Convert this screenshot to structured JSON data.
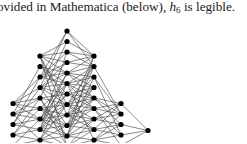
{
  "text": {
    "before": "ovided in Mathematica (below), ",
    "symbol": "h",
    "subscript": "6",
    "after": " is legible."
  },
  "figure": {
    "name": "layered-graph-h6",
    "node_color": "#000000",
    "edge_color": "#3a3a3a",
    "node_radius": 2.6,
    "node_spacing": 10.5,
    "columns": [
      {
        "x": 13,
        "y_start": 103.5
      },
      {
        "x": 40,
        "y_start": 56
      },
      {
        "x": 67,
        "y_start": 31
      },
      {
        "x": 94,
        "y_start": 56
      },
      {
        "x": 121,
        "y_start": 103.5
      },
      {
        "x": 148,
        "y_start": 130.5,
        "count": 1
      }
    ]
  }
}
